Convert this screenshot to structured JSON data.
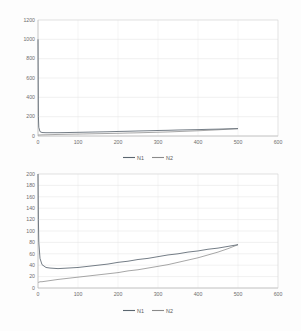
{
  "page": {
    "background": "#fdfdfd",
    "width": 301,
    "height": 331
  },
  "colors": {
    "series_n1": "#5b6670",
    "series_n2": "#8a8a8a",
    "gridline": "#dcdcdc",
    "axis": "#b9b9b9",
    "tick_text": "#6d6d6d"
  },
  "chart_data": [
    {
      "id": "top",
      "type": "line",
      "title": "",
      "xlabel": "",
      "ylabel": "",
      "xlim": [
        0,
        600
      ],
      "ylim": [
        0,
        1200
      ],
      "xticks": [
        0,
        100,
        200,
        300,
        400,
        500,
        600
      ],
      "yticks": [
        0,
        200,
        400,
        600,
        800,
        1000,
        1200
      ],
      "xtick_labels": [
        "0",
        "100",
        "200",
        "300",
        "400",
        "500",
        "600"
      ],
      "ytick_labels": [
        "0",
        "200",
        "400",
        "600",
        "800",
        "1000",
        "1200"
      ],
      "grid": true,
      "legend_position": "bottom",
      "legend": [
        "N1",
        "N2"
      ],
      "x": [
        0,
        1,
        2,
        5,
        10,
        20,
        30,
        50,
        75,
        100,
        125,
        150,
        175,
        200,
        225,
        250,
        275,
        300,
        325,
        350,
        375,
        400,
        425,
        450,
        475,
        500
      ],
      "series": [
        {
          "name": "N1",
          "values": [
            1000,
            200,
            90,
            45,
            36,
            34,
            34,
            34,
            36,
            38,
            40,
            42,
            44,
            47,
            49,
            52,
            54,
            57,
            59,
            62,
            64,
            66,
            69,
            71,
            74,
            76
          ]
        },
        {
          "name": "N2",
          "values": [
            10,
            10,
            11,
            11,
            12,
            13,
            14,
            16,
            18,
            20,
            22,
            24,
            26,
            28,
            31,
            33,
            36,
            39,
            42,
            46,
            50,
            54,
            59,
            64,
            70,
            76
          ]
        }
      ]
    },
    {
      "id": "bottom",
      "type": "line",
      "title": "",
      "xlabel": "",
      "ylabel": "",
      "xlim": [
        0,
        600
      ],
      "ylim": [
        0,
        200
      ],
      "xticks": [
        0,
        100,
        200,
        300,
        400,
        500,
        600
      ],
      "yticks": [
        0,
        20,
        40,
        60,
        80,
        100,
        120,
        140,
        160,
        180,
        200
      ],
      "xtick_labels": [
        "0",
        "100",
        "200",
        "300",
        "400",
        "500",
        "600"
      ],
      "ytick_labels": [
        "0",
        "20",
        "40",
        "60",
        "80",
        "100",
        "120",
        "140",
        "160",
        "180",
        "200"
      ],
      "grid": true,
      "legend_position": "bottom",
      "legend": [
        "N1",
        "N2"
      ],
      "x": [
        0,
        1,
        2,
        5,
        10,
        20,
        30,
        50,
        75,
        100,
        125,
        150,
        175,
        200,
        225,
        250,
        275,
        300,
        325,
        350,
        375,
        400,
        425,
        450,
        475,
        500
      ],
      "series": [
        {
          "name": "N1",
          "values": [
            200,
            120,
            80,
            52,
            41,
            36,
            35,
            34,
            35,
            36,
            38,
            40,
            42,
            45,
            47,
            50,
            52,
            55,
            58,
            60,
            63,
            65,
            68,
            70,
            73,
            76
          ]
        },
        {
          "name": "N2",
          "values": [
            10,
            10,
            10,
            11,
            11,
            12,
            13,
            15,
            17,
            19,
            21,
            23,
            25,
            27,
            30,
            32,
            35,
            38,
            41,
            45,
            49,
            53,
            58,
            63,
            69,
            76
          ]
        }
      ]
    }
  ]
}
